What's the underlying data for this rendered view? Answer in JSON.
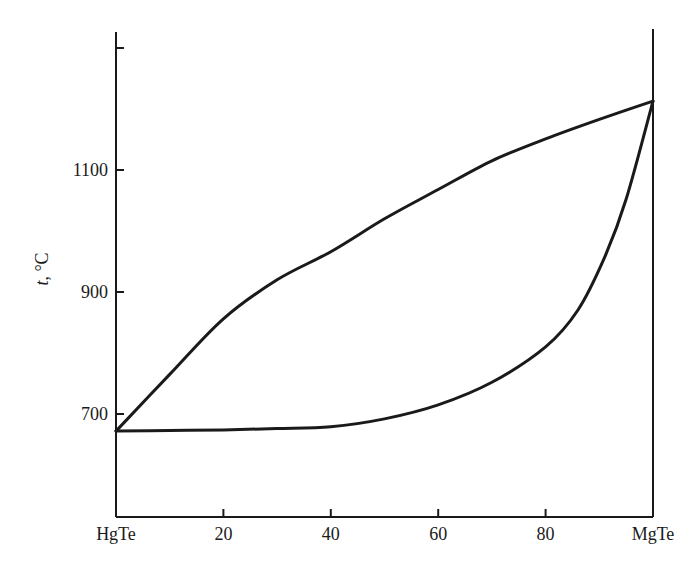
{
  "chart_data": {
    "type": "line",
    "title": "",
    "xlabel": "",
    "ylabel": "t, °C",
    "ylabel_italic_part": "t",
    "ylabel_rest": ", °C",
    "xlim": [
      0,
      100
    ],
    "ylim": [
      550,
      1330
    ],
    "x_ticks": [
      {
        "value": 0,
        "label": "HgTe"
      },
      {
        "value": 20,
        "label": "20"
      },
      {
        "value": 40,
        "label": "40"
      },
      {
        "value": 60,
        "label": "60"
      },
      {
        "value": 80,
        "label": "80"
      },
      {
        "value": 100,
        "label": "MgTe"
      }
    ],
    "y_ticks": [
      {
        "value": 700,
        "label": "700"
      },
      {
        "value": 900,
        "label": "900"
      },
      {
        "value": 1100,
        "label": "1100"
      },
      {
        "value": 1300,
        "label": ""
      }
    ],
    "grid": false,
    "legend": null,
    "series": [
      {
        "name": "liquidus",
        "x": [
          0,
          10,
          20,
          30,
          40,
          50,
          60,
          70,
          80,
          90,
          100
        ],
        "y": [
          672,
          765,
          856,
          920,
          966,
          1020,
          1068,
          1115,
          1151,
          1183,
          1213
        ]
      },
      {
        "name": "solidus",
        "x": [
          0,
          10,
          20,
          30,
          40,
          50,
          60,
          70,
          80,
          86,
          91,
          95,
          100
        ],
        "y": [
          672,
          673,
          674,
          676,
          679,
          692,
          715,
          752,
          810,
          870,
          957,
          1052,
          1213
        ]
      }
    ]
  }
}
